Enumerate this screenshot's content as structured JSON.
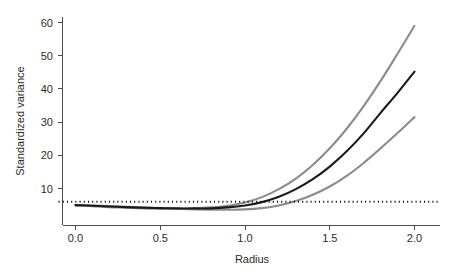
{
  "chart_data": {
    "type": "line",
    "title": "",
    "subtitle": "",
    "xlabel": "Radius",
    "ylabel": "Standardized variance",
    "xlim": [
      -0.1,
      2.15
    ],
    "ylim": [
      0,
      63
    ],
    "xticks": [
      0.0,
      0.5,
      1.0,
      1.5,
      2.0
    ],
    "xticklabels": [
      "0.0",
      "0.5",
      "1.0",
      "1.5",
      "2.0"
    ],
    "yticks": [
      10,
      20,
      30,
      40,
      50,
      60
    ],
    "yticklabels": [
      "10",
      "20",
      "30",
      "40",
      "50",
      "60"
    ],
    "grid": false,
    "legend": "none",
    "axis_style": "L-shaped open frame, ticks outward",
    "colors": {
      "black_curve": "#1a1a1a",
      "gray_curve": "#8c8c8c",
      "dotted_line": "#111111",
      "axis": "#4d4d4d",
      "background": "#ffffff"
    },
    "series": [
      {
        "name": "upper-gray-curve",
        "style": "solid",
        "color": "#8c8c8c",
        "x": [
          0.0,
          0.1,
          0.2,
          0.3,
          0.4,
          0.5,
          0.6,
          0.7,
          0.8,
          0.9,
          1.0,
          1.1,
          1.2,
          1.3,
          1.4,
          1.5,
          1.6,
          1.7,
          1.8,
          1.9,
          2.0
        ],
        "values": [
          5.0,
          4.7,
          4.4,
          4.2,
          4.0,
          3.9,
          3.9,
          4.0,
          4.3,
          4.8,
          5.8,
          7.4,
          9.8,
          13.0,
          17.1,
          22.1,
          28.0,
          34.8,
          42.4,
          50.6,
          59.0
        ]
      },
      {
        "name": "middle-black-curve",
        "style": "solid",
        "color": "#1a1a1a",
        "x": [
          0.0,
          0.1,
          0.2,
          0.3,
          0.4,
          0.5,
          0.6,
          0.7,
          0.8,
          0.9,
          1.0,
          1.1,
          1.2,
          1.3,
          1.4,
          1.5,
          1.6,
          1.7,
          1.8,
          1.9,
          2.0
        ],
        "values": [
          5.0,
          4.8,
          4.6,
          4.4,
          4.2,
          4.1,
          4.0,
          4.0,
          4.0,
          4.3,
          4.9,
          5.9,
          7.5,
          9.8,
          12.8,
          16.6,
          21.2,
          26.6,
          32.8,
          38.8,
          45.2
        ]
      },
      {
        "name": "lower-gray-curve",
        "style": "solid",
        "color": "#8c8c8c",
        "x": [
          0.0,
          0.1,
          0.2,
          0.3,
          0.4,
          0.5,
          0.6,
          0.7,
          0.8,
          0.9,
          1.0,
          1.1,
          1.2,
          1.3,
          1.4,
          1.5,
          1.6,
          1.7,
          1.8,
          1.9,
          2.0
        ],
        "values": [
          5.0,
          4.9,
          4.7,
          4.5,
          4.3,
          4.1,
          3.9,
          3.7,
          3.6,
          3.6,
          3.7,
          4.1,
          4.9,
          6.2,
          8.1,
          10.6,
          13.8,
          17.7,
          22.1,
          26.7,
          31.5
        ]
      },
      {
        "name": "reference-dotted-line",
        "style": "dotted",
        "color": "#111111",
        "x": [
          -0.1,
          2.15
        ],
        "values": [
          6.0,
          6.0
        ]
      }
    ]
  },
  "axes": {
    "x_axis_name": "Radius",
    "y_axis_name": "Standardized variance"
  }
}
